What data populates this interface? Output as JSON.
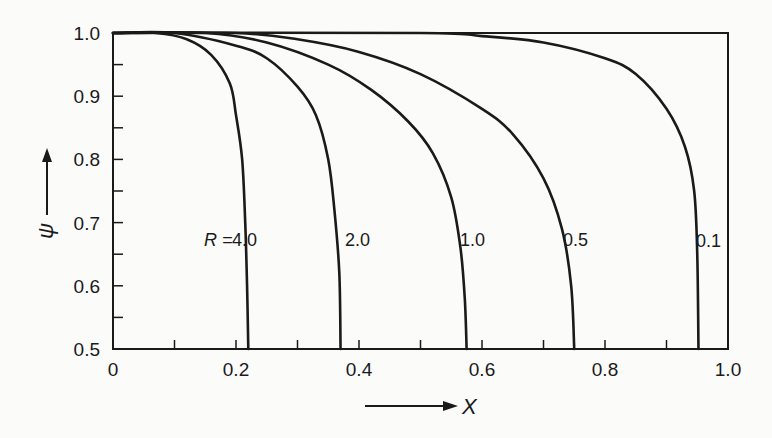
{
  "chart_data": {
    "type": "line",
    "title": "",
    "xlabel": "X",
    "ylabel": "ψ",
    "xlim": [
      0,
      1.0
    ],
    "ylim": [
      0.5,
      1.0
    ],
    "grid": false,
    "legend_position": "inline curve labels",
    "x_ticks": [
      "0",
      "0.2",
      "0.4",
      "0.6",
      "0.8",
      "1.0"
    ],
    "y_ticks": [
      "0.5",
      "0.6",
      "0.7",
      "0.8",
      "0.9",
      "1.0"
    ],
    "annotation": "R =",
    "series": [
      {
        "name": "4.0",
        "label": "4.0",
        "x": [
          0.0,
          0.07,
          0.12,
          0.16,
          0.19,
          0.2,
          0.21,
          0.215,
          0.218,
          0.22
        ],
        "y": [
          1.0,
          1.0,
          0.99,
          0.965,
          0.92,
          0.87,
          0.8,
          0.7,
          0.6,
          0.5
        ]
      },
      {
        "name": "2.0",
        "label": "2.0",
        "x": [
          0.0,
          0.1,
          0.2,
          0.25,
          0.3,
          0.33,
          0.35,
          0.36,
          0.368,
          0.37
        ],
        "y": [
          1.0,
          1.0,
          0.98,
          0.96,
          0.915,
          0.87,
          0.8,
          0.72,
          0.62,
          0.5
        ]
      },
      {
        "name": "1.0",
        "label": "1.0",
        "x": [
          0.0,
          0.15,
          0.25,
          0.35,
          0.42,
          0.48,
          0.52,
          0.55,
          0.565,
          0.572,
          0.575
        ],
        "y": [
          1.0,
          1.0,
          0.985,
          0.95,
          0.91,
          0.86,
          0.81,
          0.74,
          0.66,
          0.58,
          0.5
        ]
      },
      {
        "name": "0.5",
        "label": "0.5",
        "x": [
          0.0,
          0.2,
          0.3,
          0.4,
          0.5,
          0.6,
          0.65,
          0.7,
          0.73,
          0.745,
          0.75
        ],
        "y": [
          1.0,
          1.0,
          0.99,
          0.97,
          0.935,
          0.88,
          0.84,
          0.77,
          0.69,
          0.6,
          0.5
        ]
      },
      {
        "name": "0.1",
        "label": "0.1",
        "x": [
          0.0,
          0.5,
          0.6,
          0.7,
          0.8,
          0.85,
          0.9,
          0.93,
          0.945,
          0.95,
          0.952
        ],
        "y": [
          1.0,
          1.0,
          0.995,
          0.985,
          0.96,
          0.935,
          0.88,
          0.82,
          0.75,
          0.65,
          0.5
        ]
      }
    ]
  },
  "labels": {
    "r_prefix": "R =",
    "x_axis": "X",
    "y_axis": "ψ"
  }
}
